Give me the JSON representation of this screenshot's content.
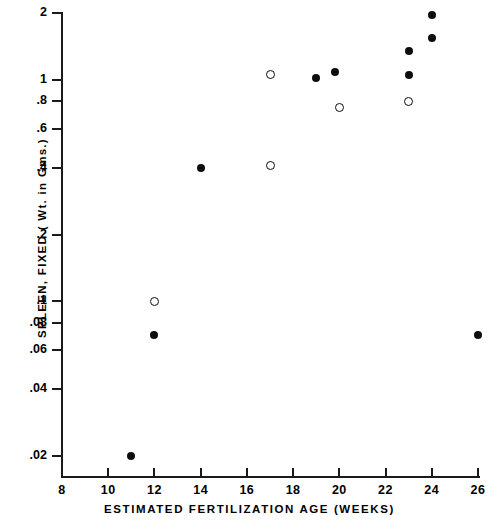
{
  "chart_data": {
    "type": "scatter",
    "title": "",
    "xlabel": "ESTIMATED FERTILIZATION AGE (WEEKS)",
    "ylabel": "SPLEEN, FIXED ( Wt. in Gms.)",
    "xlim": [
      8,
      26
    ],
    "ylim": [
      0.018,
      2.2
    ],
    "yscale": "log",
    "xscale": "linear",
    "grid": false,
    "legend": "none",
    "xticks": [
      8,
      10,
      12,
      14,
      16,
      18,
      20,
      22,
      24,
      26
    ],
    "xticklabels": [
      "8",
      "10",
      "12",
      "14",
      "16",
      "18",
      "20",
      "22",
      "24",
      "26"
    ],
    "yticks": [
      0.02,
      0.04,
      0.06,
      0.08,
      0.1,
      0.2,
      0.4,
      0.6,
      0.8,
      1,
      2
    ],
    "yticklabels": [
      ".02",
      ".04",
      ".06",
      ".08",
      ".1",
      ".2",
      ".4",
      ".6",
      ".8",
      "1",
      "2"
    ],
    "series": [
      {
        "name": "filled",
        "marker": "filled-circle",
        "color": "#0d0d0d",
        "points": [
          {
            "x": 11,
            "y": 0.02
          },
          {
            "x": 12,
            "y": 0.07
          },
          {
            "x": 14,
            "y": 0.4
          },
          {
            "x": 19,
            "y": 1.02
          },
          {
            "x": 19.8,
            "y": 1.08
          },
          {
            "x": 23,
            "y": 1.05
          },
          {
            "x": 23,
            "y": 1.35
          },
          {
            "x": 24,
            "y": 1.55
          },
          {
            "x": 24,
            "y": 1.95
          },
          {
            "x": 26,
            "y": 0.07
          }
        ]
      },
      {
        "name": "open",
        "marker": "open-circle",
        "color": "#0d0d0d",
        "points": [
          {
            "x": 12,
            "y": 0.1
          },
          {
            "x": 17,
            "y": 0.41
          },
          {
            "x": 17,
            "y": 1.05
          },
          {
            "x": 20,
            "y": 0.75
          },
          {
            "x": 23,
            "y": 0.8
          }
        ]
      }
    ]
  }
}
